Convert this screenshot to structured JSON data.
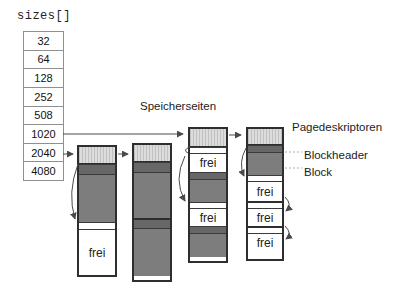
{
  "title_label": "sizes[]",
  "sizes_table": {
    "values": [
      "32",
      "64",
      "128",
      "252",
      "508",
      "1020",
      "2040",
      "4080"
    ]
  },
  "labels": {
    "memory_pages": "Speicherseiten",
    "page_descriptors": "Pagedeskriptoren",
    "block_header": "Blockheader",
    "block": "Block"
  },
  "colors": {
    "descriptor_fill": "#dcdcdc",
    "block_fill": "#7d7d7d",
    "blockheader_fill": "#676767",
    "free_fill": "#ffffff",
    "outline": "#2e2e2e",
    "table_border": "#8f8f8f",
    "arrow": "#4a4a4a",
    "dotted_line": "#aaaaaa"
  },
  "pages": [
    {
      "name": "page-2040-first",
      "segments": [
        {
          "type": "descriptor"
        },
        {
          "type": "block-header"
        },
        {
          "type": "block"
        },
        {
          "type": "free-header"
        },
        {
          "type": "free",
          "label": "frei"
        }
      ]
    },
    {
      "name": "page-2040-second",
      "segments": [
        {
          "type": "descriptor"
        },
        {
          "type": "block-header"
        },
        {
          "type": "block"
        },
        {
          "type": "block-header"
        },
        {
          "type": "block"
        }
      ]
    },
    {
      "name": "page-1020-first",
      "segments": [
        {
          "type": "descriptor"
        },
        {
          "type": "free-header"
        },
        {
          "type": "free",
          "label": "frei"
        },
        {
          "type": "block-header"
        },
        {
          "type": "block"
        },
        {
          "type": "free-header"
        },
        {
          "type": "free",
          "label": "frei"
        },
        {
          "type": "block-header"
        },
        {
          "type": "block"
        }
      ]
    },
    {
      "name": "page-1020-second",
      "segments": [
        {
          "type": "descriptor"
        },
        {
          "type": "block-header"
        },
        {
          "type": "block"
        },
        {
          "type": "free-header"
        },
        {
          "type": "free",
          "label": "frei"
        },
        {
          "type": "free-header"
        },
        {
          "type": "free",
          "label": "frei"
        },
        {
          "type": "free-header"
        },
        {
          "type": "free",
          "label": "frei"
        }
      ]
    }
  ]
}
